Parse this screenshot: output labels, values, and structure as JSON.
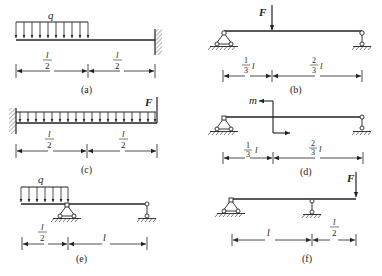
{
  "figures": {
    "a": {
      "caption": "(a)",
      "load_label": "q",
      "dims": [
        {
          "num": "l",
          "den": "2"
        },
        {
          "num": "l",
          "den": "2"
        }
      ],
      "description": "Cantilever fixed at right end, uniformly distributed load q over left half"
    },
    "b": {
      "caption": "(b)",
      "force_label": "F",
      "dims": [
        {
          "coef_num": "1",
          "coef_den": "3",
          "var": "l"
        },
        {
          "coef_num": "2",
          "coef_den": "3",
          "var": "l"
        }
      ],
      "description": "Simply supported beam with point load F at l/3 from left pin support"
    },
    "c": {
      "caption": "(c)",
      "force_label": "F",
      "dims": [
        {
          "num": "l",
          "den": "2"
        },
        {
          "num": "l",
          "den": "2"
        }
      ],
      "description": "Cantilever fixed at left end, full-length distributed load and upward force F at free end"
    },
    "d": {
      "caption": "(d)",
      "moment_label": "m",
      "dims": [
        {
          "coef_num": "1",
          "coef_den": "3",
          "var": "l"
        },
        {
          "coef_num": "2",
          "coef_den": "3",
          "var": "l"
        }
      ],
      "description": "Simply supported beam with concentrated couple m at l/3"
    },
    "e": {
      "caption": "(e)",
      "load_label": "q",
      "dims": [
        {
          "num": "l",
          "den": "2"
        },
        {
          "single": "l"
        }
      ],
      "description": "Overhanging beam, distributed load q on left overhang of length l/2, span l"
    },
    "f": {
      "caption": "(f)",
      "force_label": "F",
      "dims": [
        {
          "single": "l"
        },
        {
          "num": "l",
          "den": "2"
        }
      ],
      "description": "Overhanging beam, span l, overhang l/2 with point load F at free end"
    }
  }
}
